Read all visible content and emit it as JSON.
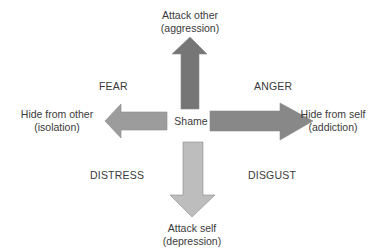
{
  "center": {
    "label": "Shame"
  },
  "arrows": {
    "up": {
      "line1": "Attack other",
      "line2": "(aggression)",
      "color": "#767676"
    },
    "left": {
      "line1": "Hide from other",
      "line2": "(isolation)",
      "color": "#9c9c9c"
    },
    "right": {
      "line1": "Hide from self",
      "line2": "(addiction)",
      "color": "#888888"
    },
    "down": {
      "line1": "Attack self",
      "line2": "(depression)",
      "color": "#bdbdbd"
    }
  },
  "emotions": {
    "top_left": "FEAR",
    "top_right": "ANGER",
    "bottom_left": "DISTRESS",
    "bottom_right": "DISGUST"
  }
}
